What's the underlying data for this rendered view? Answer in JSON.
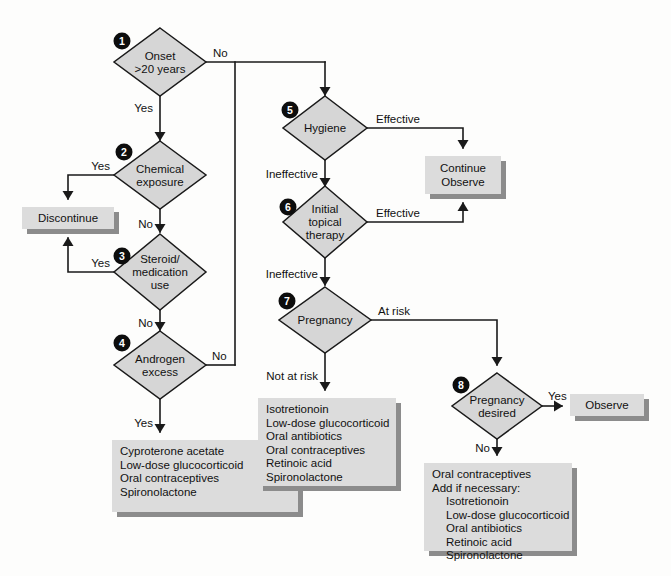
{
  "diagram": {
    "type": "flowchart",
    "canvas": {
      "width": 671,
      "height": 576
    },
    "colors": {
      "background": "#fdfdfc",
      "diamond_fill": "#d6d6d6",
      "box_fill": "#dcdcdc",
      "box_shadow": "#8c8c8c",
      "stroke": "#1a1a1a",
      "number_badge": "#0d0d0d",
      "number_text": "#ffffff"
    },
    "decision_nodes": [
      {
        "id": "node-1",
        "number": "1",
        "lines": [
          "Onset",
          ">20 years"
        ],
        "cx": 160,
        "cy": 62,
        "rx": 46,
        "ry": 34,
        "badge_x": 122,
        "badge_y": 41
      },
      {
        "id": "node-2",
        "number": "2",
        "lines": [
          "Chemical",
          "exposure"
        ],
        "cx": 160,
        "cy": 175,
        "rx": 46,
        "ry": 34,
        "badge_x": 124,
        "badge_y": 152
      },
      {
        "id": "node-3",
        "number": "3",
        "lines": [
          "Steroid/",
          "medication",
          "use"
        ],
        "cx": 160,
        "cy": 272,
        "rx": 46,
        "ry": 38,
        "badge_x": 122,
        "badge_y": 256
      },
      {
        "id": "node-4",
        "number": "4",
        "lines": [
          "Androgen",
          "excess"
        ],
        "cx": 160,
        "cy": 365,
        "rx": 46,
        "ry": 34,
        "badge_x": 122,
        "badge_y": 343
      },
      {
        "id": "node-5",
        "number": "5",
        "lines": [
          "Hygiene"
        ],
        "cx": 325,
        "cy": 128,
        "rx": 42,
        "ry": 32,
        "badge_x": 290,
        "badge_y": 110
      },
      {
        "id": "node-6",
        "number": "6",
        "lines": [
          "Initial",
          "topical",
          "therapy"
        ],
        "cx": 325,
        "cy": 222,
        "rx": 42,
        "ry": 36,
        "badge_x": 288,
        "badge_y": 207
      },
      {
        "id": "node-7",
        "number": "7",
        "lines": [
          "Pregnancy"
        ],
        "cx": 325,
        "cy": 320,
        "rx": 46,
        "ry": 33,
        "badge_x": 287,
        "badge_y": 301
      },
      {
        "id": "node-8",
        "number": "8",
        "lines": [
          "Pregnancy",
          "desired"
        ],
        "cx": 497,
        "cy": 406,
        "rx": 45,
        "ry": 33,
        "badge_x": 461,
        "badge_y": 385
      }
    ],
    "terminal_boxes": [
      {
        "id": "box-discontinue",
        "x": 22,
        "y": 207,
        "width": 92,
        "height": 22,
        "align": "center",
        "lines": [
          "Discontinue"
        ]
      },
      {
        "id": "box-continue-observe",
        "x": 425,
        "y": 156,
        "width": 76,
        "height": 38,
        "align": "center",
        "lines": [
          "Continue",
          "Observe"
        ]
      },
      {
        "id": "box-observe",
        "x": 570,
        "y": 394,
        "width": 74,
        "height": 22,
        "align": "center",
        "lines": [
          "Observe"
        ]
      },
      {
        "id": "box-androgen-treatment",
        "x": 112,
        "y": 440,
        "width": 186,
        "height": 72,
        "align": "left",
        "lines": [
          "Cyproterone acetate",
          "Low-dose glucocorticoid",
          "Oral contraceptives",
          "Spironolactone"
        ]
      },
      {
        "id": "box-not-at-risk-treatment",
        "x": 258,
        "y": 398,
        "width": 138,
        "height": 88,
        "align": "left",
        "lines": [
          "Isotretionoin",
          "Low-dose glucocorticoid",
          "Oral antibiotics",
          "Oral contraceptives",
          "Retinoic acid",
          "Spironolactone"
        ]
      },
      {
        "id": "box-pregnancy-not-desired-treatment",
        "x": 424,
        "y": 463,
        "width": 148,
        "height": 88,
        "align": "left",
        "lines": [
          "Oral contraceptives",
          "Add if necessary:",
          "   Isotretionoin",
          "   Low-dose glucocorticoid",
          "   Oral antibiotics",
          "   Retinoic acid",
          "   Spironolactone"
        ]
      }
    ],
    "edges": [
      {
        "id": "edge-1-yes",
        "path": "M 160 96 L 160 140",
        "arrow": "down",
        "arrow_x": 160,
        "arrow_y": 141
      },
      {
        "id": "edge-1-no",
        "path": "M 206 62 L 325 62",
        "arrow": "none"
      },
      {
        "id": "edge-no-trunk-to-5",
        "path": "M 325 62 L 325 95",
        "arrow": "down",
        "arrow_x": 325,
        "arrow_y": 96
      },
      {
        "id": "edge-no-trunk-down",
        "path": "M 235 62 L 235 365",
        "arrow": "none"
      },
      {
        "id": "edge-2-yes",
        "path": "M 114 175 L 68 175 L 68 199",
        "arrow": "down",
        "arrow_x": 68,
        "arrow_y": 200
      },
      {
        "id": "edge-2-no",
        "path": "M 160 209 L 160 232",
        "arrow": "down",
        "arrow_x": 160,
        "arrow_y": 233
      },
      {
        "id": "edge-3-yes",
        "path": "M 114 272 L 68 272 L 68 238",
        "arrow": "up",
        "arrow_x": 68,
        "arrow_y": 237
      },
      {
        "id": "edge-3-no",
        "path": "M 160 310 L 160 330",
        "arrow": "down",
        "arrow_x": 160,
        "arrow_y": 331
      },
      {
        "id": "edge-4-no",
        "path": "M 206 365 L 235 365",
        "arrow": "none"
      },
      {
        "id": "edge-4-yes",
        "path": "M 160 399 L 160 432",
        "arrow": "down",
        "arrow_x": 160,
        "arrow_y": 433
      },
      {
        "id": "edge-5-effective",
        "path": "M 367 128 L 463 128 L 463 148",
        "arrow": "down",
        "arrow_x": 463,
        "arrow_y": 149
      },
      {
        "id": "edge-5-ineffective",
        "path": "M 325 160 L 325 186",
        "arrow": "down",
        "arrow_x": 325,
        "arrow_y": 187
      },
      {
        "id": "edge-6-effective",
        "path": "M 367 222 L 463 222 L 463 203",
        "arrow": "up",
        "arrow_x": 463,
        "arrow_y": 202
      },
      {
        "id": "edge-6-ineffective",
        "path": "M 325 258 L 325 285",
        "arrow": "down",
        "arrow_x": 325,
        "arrow_y": 286
      },
      {
        "id": "edge-7-atrisk",
        "path": "M 371 320 L 497 320 L 497 365",
        "arrow": "down",
        "arrow_x": 497,
        "arrow_y": 366
      },
      {
        "id": "edge-7-notatrisk",
        "path": "M 325 353 L 325 390",
        "arrow": "down",
        "arrow_x": 325,
        "arrow_y": 391
      },
      {
        "id": "edge-8-yes",
        "path": "M 542 406 L 562 406",
        "arrow": "right",
        "arrow_x": 563,
        "arrow_y": 406
      },
      {
        "id": "edge-8-no",
        "path": "M 497 439 L 497 455",
        "arrow": "down",
        "arrow_x": 497,
        "arrow_y": 456
      }
    ],
    "edge_labels": [
      {
        "id": "label-1-no",
        "text": "No",
        "x": 213,
        "y": 57,
        "anchor": "start"
      },
      {
        "id": "label-1-yes",
        "text": "Yes",
        "x": 153,
        "y": 112,
        "anchor": "end"
      },
      {
        "id": "label-2-yes",
        "text": "Yes",
        "x": 110,
        "y": 170,
        "anchor": "end"
      },
      {
        "id": "label-2-no",
        "text": "No",
        "x": 153,
        "y": 228,
        "anchor": "end"
      },
      {
        "id": "label-3-yes",
        "text": "Yes",
        "x": 110,
        "y": 267,
        "anchor": "end"
      },
      {
        "id": "label-3-no",
        "text": "No",
        "x": 153,
        "y": 327,
        "anchor": "end"
      },
      {
        "id": "label-4-no",
        "text": "No",
        "x": 212,
        "y": 360,
        "anchor": "start"
      },
      {
        "id": "label-4-yes",
        "text": "Yes",
        "x": 153,
        "y": 427,
        "anchor": "end"
      },
      {
        "id": "label-5-effective",
        "text": "Effective",
        "x": 376,
        "y": 123,
        "anchor": "start"
      },
      {
        "id": "label-5-ineffective",
        "text": "Ineffective",
        "x": 318,
        "y": 178,
        "anchor": "end"
      },
      {
        "id": "label-6-effective",
        "text": "Effective",
        "x": 376,
        "y": 217,
        "anchor": "start"
      },
      {
        "id": "label-6-ineffective",
        "text": "Ineffective",
        "x": 318,
        "y": 278,
        "anchor": "end"
      },
      {
        "id": "label-7-atrisk",
        "text": "At risk",
        "x": 378,
        "y": 315,
        "anchor": "start"
      },
      {
        "id": "label-7-notatrisk",
        "text": "Not at risk",
        "x": 318,
        "y": 380,
        "anchor": "end"
      },
      {
        "id": "label-8-yes",
        "text": "Yes",
        "x": 548,
        "y": 400,
        "anchor": "start"
      },
      {
        "id": "label-8-no",
        "text": "No",
        "x": 490,
        "y": 452,
        "anchor": "end"
      }
    ]
  }
}
